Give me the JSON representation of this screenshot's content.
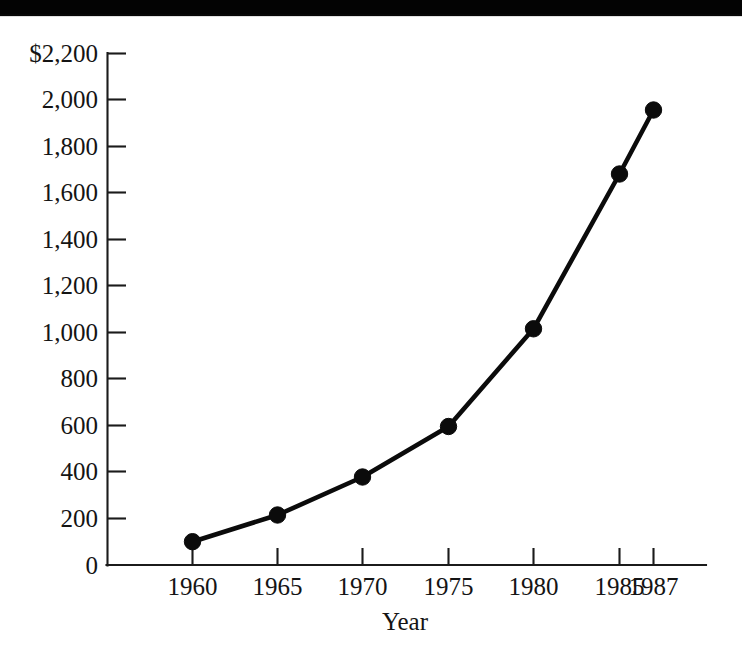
{
  "figure": {
    "background_color": "#ffffff",
    "ink_color": "#0b0b0b",
    "scan_band_color": "#030303"
  },
  "chart_data": {
    "type": "line",
    "title": "",
    "subtitle": "",
    "xlabel": "Year",
    "ylabel": "",
    "categories": [
      "1960",
      "1965",
      "1970",
      "1975",
      "1980",
      "1985",
      "1987"
    ],
    "x": [
      1960,
      1965,
      1970,
      1975,
      1980,
      1985,
      1987
    ],
    "values": [
      100,
      215,
      378,
      595,
      1015,
      1680,
      1955
    ],
    "series": [
      {
        "name": "",
        "values": [
          100,
          215,
          378,
          595,
          1015,
          1680,
          1955
        ]
      }
    ],
    "ylim": [
      0,
      2200
    ],
    "xlim": [
      1960,
      1987
    ],
    "ytick_labels": [
      "$2,200",
      "2,000",
      "1,800",
      "1,600",
      "1,400",
      "1,200",
      "1,000",
      "800",
      "600",
      "400",
      "200",
      "0"
    ],
    "ytick_values": [
      2200,
      2000,
      1800,
      1600,
      1400,
      1200,
      1000,
      800,
      600,
      400,
      200,
      0
    ],
    "xtick_labels": [
      "1960",
      "1965",
      "1970",
      "1975",
      "1980",
      "1985",
      "1987"
    ],
    "xtick_values": [
      1960,
      1965,
      1970,
      1975,
      1980,
      1985,
      1987
    ],
    "grid": false,
    "legend": false,
    "legend_position": "none",
    "marker": "filled-circle",
    "currency_prefix": "$",
    "annotations": []
  },
  "axes": {
    "y_axis_label_top": "$2,200",
    "y_axis_label_bottom": "0",
    "x_axis_title": "Year"
  }
}
